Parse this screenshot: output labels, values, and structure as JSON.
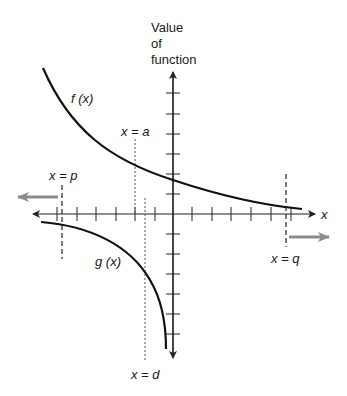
{
  "diagram": {
    "y_axis_label": [
      "Value",
      "of",
      "function"
    ],
    "x_axis_label": "x",
    "curves": [
      {
        "name": "f (x)",
        "label": "f (x)"
      },
      {
        "name": "g (x)",
        "label": "g (x)"
      }
    ],
    "asymptotes": {
      "p": {
        "label": "x = p",
        "style": "dashed"
      },
      "a": {
        "label": "x = a",
        "style": "dotted"
      },
      "d": {
        "label": "x = d",
        "style": "dotted"
      },
      "q": {
        "label": "x = q",
        "style": "dashed"
      }
    },
    "direction_arrows": {
      "left": "arrow pointing left, beyond x = p",
      "right": "arrow pointing right, beyond x = q"
    },
    "x_ticks_left": 6,
    "x_ticks_right": 6,
    "y_ticks_up": 6,
    "y_ticks_down": 6,
    "colors": {
      "curve": "#111111",
      "axis": "#222222",
      "direction_arrow": "#8c8c8c",
      "asymptote": "#333333"
    }
  }
}
